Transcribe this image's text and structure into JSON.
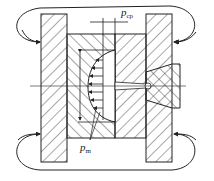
{
  "diagram": {
    "labels": {
      "p_cp": {
        "main": "p",
        "sub": "cp"
      },
      "p_m": {
        "main": "p",
        "sub": "m"
      },
      "dim": "r"
    },
    "colors": {
      "line": "#1a1a1a",
      "background": "#ffffff"
    }
  }
}
